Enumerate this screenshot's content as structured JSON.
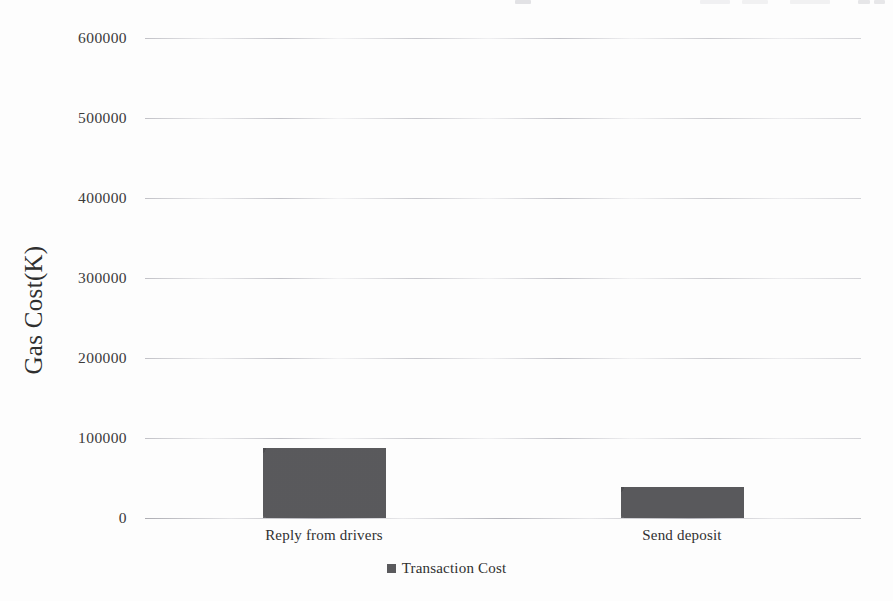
{
  "chart_data": {
    "type": "bar",
    "title": "",
    "xlabel": "",
    "ylabel": "Gas Cost(K)",
    "categories": [
      "Reply from drivers",
      "Send deposit"
    ],
    "series": [
      {
        "name": "Transaction Cost",
        "values": [
          87000,
          39000
        ]
      }
    ],
    "values": [
      87000,
      39000
    ],
    "ylim": [
      0,
      600000
    ],
    "yticks": [
      0,
      100000,
      200000,
      300000,
      400000,
      500000,
      600000
    ],
    "ytick_labels": [
      "0",
      "100000",
      "200000",
      "300000",
      "400000",
      "500000",
      "600000"
    ],
    "grid": true,
    "legend_position": "bottom",
    "bar_color": "#57575a",
    "background_color": "#fdfdfd",
    "gridline_color": "#a8a8b0"
  },
  "axes": {
    "y_title": "Gas Cost(K)"
  },
  "legend": {
    "items": [
      {
        "label": "Transaction Cost",
        "color": "#5a5a5d",
        "marker": "square-marker"
      }
    ]
  }
}
